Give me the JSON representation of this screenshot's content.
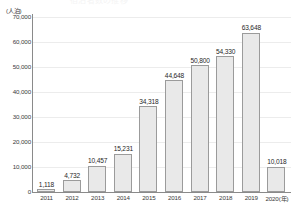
{
  "title_faint": "宿泊者数の推移",
  "axis": {
    "y_unit_label": "(人泊)",
    "x_unit_suffix": "(年)"
  },
  "chart_data": {
    "type": "bar",
    "title": "",
    "xlabel": "",
    "ylabel": "(人泊)",
    "ylim": [
      0,
      70000
    ],
    "ytick_step": 10000,
    "grid": true,
    "legend": "none",
    "categories": [
      "2011",
      "2012",
      "2013",
      "2014",
      "2015",
      "2016",
      "2017",
      "2018",
      "2019",
      "2020"
    ],
    "last_category_label": "2020(年)",
    "values": [
      1118,
      4732,
      10457,
      15231,
      34318,
      44648,
      50800,
      54330,
      63648,
      10018
    ],
    "data_labels": [
      "1,118",
      "4,732",
      "10,457",
      "15,231",
      "34,318",
      "44,648",
      "50,800",
      "54,330",
      "63,648",
      "10,018"
    ],
    "ytick_labels": [
      "70,000",
      "60,000",
      "50,000",
      "40,000",
      "30,000",
      "20,000",
      "10,000",
      "0"
    ],
    "ytick_values": [
      70000,
      60000,
      50000,
      40000,
      30000,
      20000,
      10000,
      0
    ],
    "colors": {
      "bar_fill": "#e9e9e9",
      "bar_border": "#9b9b9b",
      "gridline": "#ececec",
      "axis": "#8a8a8a",
      "text": "#2b2b2b",
      "background": "#ffffff"
    }
  }
}
